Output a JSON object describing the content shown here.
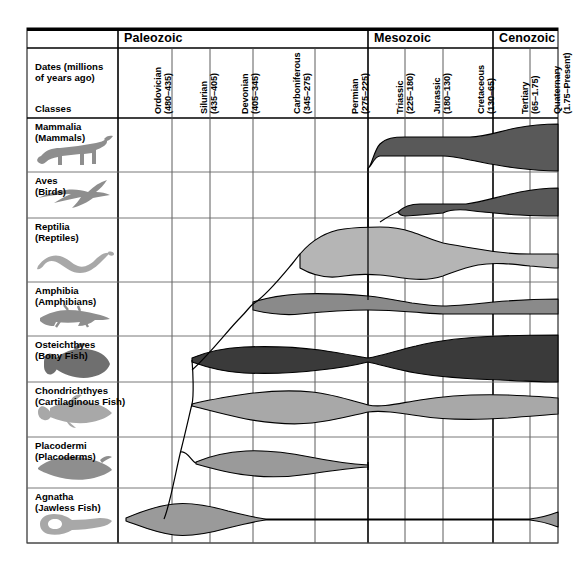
{
  "figure": {
    "corner": {
      "dates_label": "Dates (millions\nof years ago)",
      "dates_line1": "Dates (millions",
      "dates_line2": "of years ago)",
      "classes_label": "Classes"
    },
    "eras": [
      {
        "name": "Paleozoic",
        "x": 118,
        "width": 250
      },
      {
        "name": "Mesozoic",
        "x": 368,
        "width": 125
      },
      {
        "name": "Cenozoic",
        "x": 493,
        "width": 65
      }
    ],
    "periods": [
      {
        "name": "Ordovician",
        "range": "(480–435)",
        "x": 118,
        "width": 54
      },
      {
        "name": "Silurian",
        "range": "(435–405)",
        "x": 172,
        "width": 38
      },
      {
        "name": "Devonian",
        "range": "(405–345)",
        "x": 210,
        "width": 43
      },
      {
        "name": "Carboniferous",
        "range": "(345–275)",
        "x": 253,
        "width": 62
      },
      {
        "name": "Permian",
        "range": "(275–225)",
        "x": 315,
        "width": 53
      },
      {
        "name": "Triassic",
        "range": "(225–180)",
        "x": 368,
        "width": 37
      },
      {
        "name": "Jurassic",
        "range": "(180–130)",
        "x": 405,
        "width": 38
      },
      {
        "name": "Cretaceous",
        "range": "(130–65)",
        "x": 443,
        "width": 50
      },
      {
        "name": "Tertiary",
        "range": "(65–1.75)",
        "x": 493,
        "width": 37
      },
      {
        "name": "Quaternary",
        "range": "(1.75–Present)",
        "x": 530,
        "width": 28
      }
    ],
    "classes": [
      {
        "sci": "Mammalia",
        "common": "(Mammals)",
        "icon": "cat-silhouette-icon",
        "y": 118,
        "height": 54,
        "fill": "#595959"
      },
      {
        "sci": "Aves",
        "common": "(Birds)",
        "icon": "bird-silhouette-icon",
        "y": 172,
        "height": 46,
        "fill": "#595959"
      },
      {
        "sci": "Reptilia",
        "common": "(Reptiles)",
        "icon": "snake-silhouette-icon",
        "y": 218,
        "height": 64,
        "fill": "#b5b5b5"
      },
      {
        "sci": "Amphibia",
        "common": "(Amphibians)",
        "icon": "salamander-silhouette-icon",
        "y": 282,
        "height": 54,
        "fill": "#8a8a8a"
      },
      {
        "sci": "Osteichthyes",
        "common": "(Bony Fish)",
        "icon": "bony-fish-silhouette-icon",
        "y": 336,
        "height": 46,
        "fill": "#3a3a3a"
      },
      {
        "sci": "Chondrichthyes",
        "common": "(Cartilaginous Fish)",
        "icon": "shark-silhouette-icon",
        "y": 382,
        "height": 55,
        "fill": "#a8a8a8"
      },
      {
        "sci": "Placodermi",
        "common": "(Placoderms)",
        "icon": "placoderm-silhouette-icon",
        "y": 437,
        "height": 51,
        "fill": "#9a9a9a"
      },
      {
        "sci": "Agnatha",
        "common": "(Jawless Fish)",
        "icon": "lamprey-silhouette-icon",
        "y": 488,
        "height": 55,
        "fill": "#9a9a9a"
      }
    ]
  },
  "chart_data": {
    "type": "area",
    "xlabel": "Dates (millions of years ago)",
    "ylabel": "Classes",
    "grid": true,
    "legend": "none",
    "x_axis": {
      "eras": [
        "Paleozoic",
        "Mesozoic",
        "Cenozoic"
      ],
      "periods": [
        "Ordovician",
        "Silurian",
        "Devonian",
        "Carboniferous",
        "Permian",
        "Triassic",
        "Jurassic",
        "Cretaceous",
        "Tertiary",
        "Quaternary"
      ],
      "period_ranges_mya": [
        [
          480,
          435
        ],
        [
          435,
          405
        ],
        [
          405,
          345
        ],
        [
          345,
          275
        ],
        [
          275,
          225
        ],
        [
          225,
          180
        ],
        [
          180,
          130
        ],
        [
          130,
          65
        ],
        [
          65,
          1.75
        ],
        [
          1.75,
          0
        ]
      ],
      "xlim_mya": [
        480,
        0
      ]
    },
    "series": [
      {
        "name": "Mammalia",
        "common": "Mammals",
        "color": "#595959",
        "origin_period": "Triassic",
        "extinct": false,
        "abundance": [
          {
            "period": "Ordovician",
            "value": 0
          },
          {
            "period": "Silurian",
            "value": 0
          },
          {
            "period": "Devonian",
            "value": 0
          },
          {
            "period": "Carboniferous",
            "value": 0
          },
          {
            "period": "Permian",
            "value": 0
          },
          {
            "period": "Triassic",
            "value": 1
          },
          {
            "period": "Jurassic",
            "value": 2
          },
          {
            "period": "Cretaceous",
            "value": 3
          },
          {
            "period": "Tertiary",
            "value": 38
          },
          {
            "period": "Quaternary",
            "value": 42
          }
        ]
      },
      {
        "name": "Aves",
        "common": "Birds",
        "color": "#595959",
        "origin_period": "Jurassic",
        "extinct": false,
        "abundance": [
          {
            "period": "Ordovician",
            "value": 0
          },
          {
            "period": "Silurian",
            "value": 0
          },
          {
            "period": "Devonian",
            "value": 0
          },
          {
            "period": "Carboniferous",
            "value": 0
          },
          {
            "period": "Permian",
            "value": 0
          },
          {
            "period": "Triassic",
            "value": 0
          },
          {
            "period": "Jurassic",
            "value": 1
          },
          {
            "period": "Cretaceous",
            "value": 6
          },
          {
            "period": "Tertiary",
            "value": 26
          },
          {
            "period": "Quaternary",
            "value": 30
          }
        ]
      },
      {
        "name": "Reptilia",
        "common": "Reptiles",
        "color": "#b5b5b5",
        "origin_period": "Carboniferous",
        "extinct": false,
        "abundance": [
          {
            "period": "Ordovician",
            "value": 0
          },
          {
            "period": "Silurian",
            "value": 0
          },
          {
            "period": "Devonian",
            "value": 0
          },
          {
            "period": "Carboniferous",
            "value": 8
          },
          {
            "period": "Permian",
            "value": 26
          },
          {
            "period": "Triassic",
            "value": 40
          },
          {
            "period": "Jurassic",
            "value": 52
          },
          {
            "period": "Cretaceous",
            "value": 46
          },
          {
            "period": "Tertiary",
            "value": 16
          },
          {
            "period": "Quaternary",
            "value": 14
          }
        ]
      },
      {
        "name": "Amphibia",
        "common": "Amphibians",
        "color": "#8a8a8a",
        "origin_period": "Devonian",
        "extinct": false,
        "abundance": [
          {
            "period": "Ordovician",
            "value": 0
          },
          {
            "period": "Silurian",
            "value": 0
          },
          {
            "period": "Devonian",
            "value": 6
          },
          {
            "period": "Carboniferous",
            "value": 26
          },
          {
            "period": "Permian",
            "value": 22
          },
          {
            "period": "Triassic",
            "value": 10
          },
          {
            "period": "Jurassic",
            "value": 9
          },
          {
            "period": "Cretaceous",
            "value": 11
          },
          {
            "period": "Tertiary",
            "value": 17
          },
          {
            "period": "Quaternary",
            "value": 18
          }
        ]
      },
      {
        "name": "Osteichthyes",
        "common": "Bony Fish",
        "color": "#3a3a3a",
        "origin_period": "Silurian",
        "extinct": false,
        "abundance": [
          {
            "period": "Ordovician",
            "value": 0
          },
          {
            "period": "Silurian",
            "value": 2
          },
          {
            "period": "Devonian",
            "value": 22
          },
          {
            "period": "Carboniferous",
            "value": 24
          },
          {
            "period": "Permian",
            "value": 18
          },
          {
            "period": "Triassic",
            "value": 8
          },
          {
            "period": "Jurassic",
            "value": 26
          },
          {
            "period": "Cretaceous",
            "value": 38
          },
          {
            "period": "Tertiary",
            "value": 44
          },
          {
            "period": "Quaternary",
            "value": 46
          }
        ]
      },
      {
        "name": "Chondrichthyes",
        "common": "Cartilaginous Fish",
        "color": "#a8a8a8",
        "origin_period": "Silurian",
        "extinct": false,
        "abundance": [
          {
            "period": "Ordovician",
            "value": 0
          },
          {
            "period": "Silurian",
            "value": 2
          },
          {
            "period": "Devonian",
            "value": 14
          },
          {
            "period": "Carboniferous",
            "value": 30
          },
          {
            "period": "Permian",
            "value": 20
          },
          {
            "period": "Triassic",
            "value": 6
          },
          {
            "period": "Jurassic",
            "value": 8
          },
          {
            "period": "Cretaceous",
            "value": 14
          },
          {
            "period": "Tertiary",
            "value": 18
          },
          {
            "period": "Quaternary",
            "value": 18
          }
        ]
      },
      {
        "name": "Placodermi",
        "common": "Placoderms",
        "color": "#9a9a9a",
        "origin_period": "Silurian",
        "extinct": true,
        "extinction_period": "Permian",
        "abundance": [
          {
            "period": "Ordovician",
            "value": 0
          },
          {
            "period": "Silurian",
            "value": 2
          },
          {
            "period": "Devonian",
            "value": 18
          },
          {
            "period": "Carboniferous",
            "value": 8
          },
          {
            "period": "Permian",
            "value": 1
          },
          {
            "period": "Triassic",
            "value": 0
          },
          {
            "period": "Jurassic",
            "value": 0
          },
          {
            "period": "Cretaceous",
            "value": 0
          },
          {
            "period": "Tertiary",
            "value": 0
          },
          {
            "period": "Quaternary",
            "value": 0
          }
        ]
      },
      {
        "name": "Agnatha",
        "common": "Jawless Fish",
        "color": "#9a9a9a",
        "origin_period": "Ordovician",
        "extinct": false,
        "abundance": [
          {
            "period": "Ordovician",
            "value": 3
          },
          {
            "period": "Silurian",
            "value": 18
          },
          {
            "period": "Devonian",
            "value": 14
          },
          {
            "period": "Carboniferous",
            "value": 1
          },
          {
            "period": "Permian",
            "value": 1
          },
          {
            "period": "Triassic",
            "value": 1
          },
          {
            "period": "Jurassic",
            "value": 1
          },
          {
            "period": "Cretaceous",
            "value": 1
          },
          {
            "period": "Tertiary",
            "value": 1
          },
          {
            "period": "Quaternary",
            "value": 5
          }
        ]
      }
    ]
  }
}
